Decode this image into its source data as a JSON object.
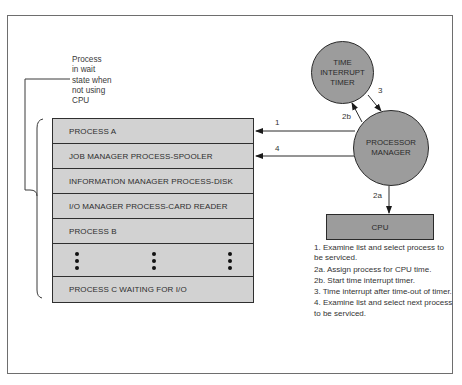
{
  "diagram": {
    "wait_note": "Process\nin wait\nstate when\nnot using\nCPU",
    "process_list": [
      "PROCESS A",
      "JOB MANAGER PROCESS-SPOOLER",
      "INFORMATION MANAGER PROCESS-DISK",
      "I/O MANAGER PROCESS-CARD READER",
      "PROCESS B",
      "",
      "PROCESS C WAITING FOR I/O"
    ],
    "nodes": {
      "timer": "TIME\nINTERRUPT\nTIMER",
      "processor_manager": "PROCESSOR\nMANAGER",
      "cpu": "CPU"
    },
    "edge_labels": {
      "e1": "1",
      "e4": "4",
      "e2a": "2a",
      "e2b": "2b",
      "e3": "3"
    },
    "steps": [
      "1. Examine list and select process to be serviced.",
      "2a. Assign process for CPU time.",
      "2b. Start time interrupt timer.",
      "3. Time interrupt after time-out of timer.",
      "4. Examine list and select next process to be serviced."
    ],
    "colors": {
      "node_fill": "#9c9c9c",
      "list_fill": "#d2d2d2",
      "line": "#2a2a2a"
    }
  }
}
